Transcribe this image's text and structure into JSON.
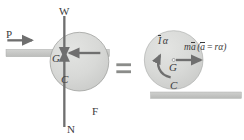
{
  "figure": {
    "type": "free-body-diagram",
    "relation_symbol": "=",
    "colors": {
      "body_fill": "#d7d8d6",
      "body_stroke": "#9a9a9a",
      "ground_fill": "#c9cac8",
      "ground_stroke": "#a5a5a5",
      "arrow": "#6f6f6f",
      "label_text": "#3a3a3a",
      "equals": "#7b7b7b",
      "background": "#ffffff"
    }
  },
  "left_diagram": {
    "name": "free-body-diagram",
    "body": {
      "shape": "circle",
      "center_x": 96,
      "center_y": 88,
      "radius": 62
    },
    "ground": {
      "x": 18,
      "y": 148,
      "width": 310,
      "height": 22
    },
    "center_marker_label": "G",
    "contact_point_label": "C",
    "forces": [
      {
        "symbol": "P",
        "name": "applied-force",
        "direction": "right",
        "label_x": 24,
        "label_y": 95
      },
      {
        "symbol": "W",
        "name": "weight-force",
        "direction": "down",
        "label_x": 188,
        "label_y": 30
      },
      {
        "symbol": "F",
        "name": "friction-force",
        "direction": "left",
        "label_x": 283,
        "label_y": 330
      },
      {
        "symbol": "N",
        "name": "normal-force",
        "direction": "up",
        "label_x": 208,
        "label_y": 385
      }
    ]
  },
  "right_diagram": {
    "name": "kinetic-diagram",
    "body": {
      "shape": "circle",
      "center_x": 521,
      "center_y": 180,
      "radius": 88
    },
    "ground": {
      "x": 452,
      "y": 276,
      "width": 272,
      "height": 18
    },
    "center_marker_label": "G",
    "contact_point_label": "C",
    "kinetic_terms": [
      {
        "symbol": "I",
        "accent": "overbar",
        "suffix": "α",
        "name": "moment-of-inertia-times-angular-acceleration",
        "arrow": "curved-counterclockwise"
      },
      {
        "symbol": "m",
        "accent": "overbar-on-a",
        "suffix": "a",
        "name": "mass-times-acceleration",
        "arrow": "straight-right"
      }
    ],
    "labels": {
      "inertia_term_I": "I",
      "inertia_term_alpha": "α",
      "ma_term_m": "m",
      "ma_term_a": "a",
      "relation_open": "(",
      "relation_a": "a",
      "relation_equals": "=",
      "relation_r": "r",
      "relation_alpha": "α",
      "relation_close": ")"
    }
  }
}
